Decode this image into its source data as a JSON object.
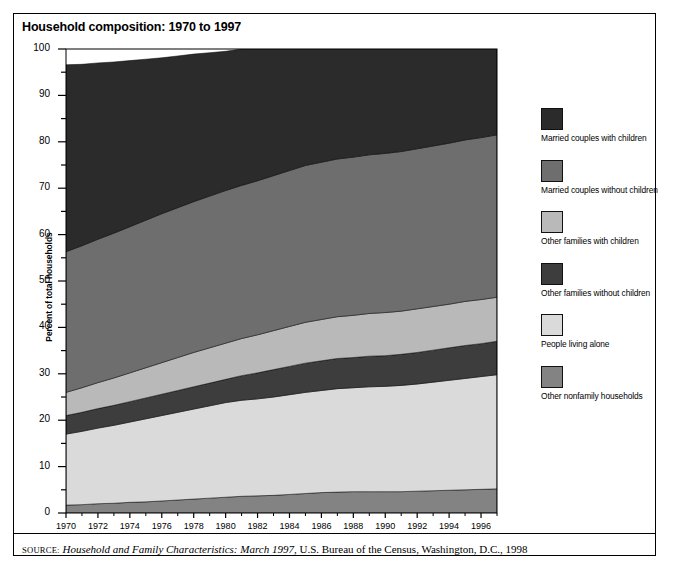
{
  "figure": {
    "title": "Household composition: 1970 to 1997",
    "source_label": "SOURCE:",
    "source_title": "Household and Family Characteristics: March 1997",
    "source_rest": ", U.S. Bureau of the Census, Washington, D.C., 1998"
  },
  "legend": {
    "items": [
      {
        "label": "Married couples with children",
        "color": "#2b2b2b"
      },
      {
        "label": "Married couples without children",
        "color": "#6e6e6e"
      },
      {
        "label": "Other families with children",
        "color": "#b9b9b9"
      },
      {
        "label": "Other families without children",
        "color": "#3d3d3d"
      },
      {
        "label": "People living alone",
        "color": "#dadada"
      },
      {
        "label": "Other nonfamily households",
        "color": "#838383"
      }
    ]
  },
  "chart_data": {
    "type": "area",
    "title": "Household composition: 1970 to 1997",
    "xlabel": "",
    "ylabel": "Percent of total households",
    "xlim": [
      1970,
      1997
    ],
    "ylim": [
      0,
      100
    ],
    "grid": false,
    "stacked": true,
    "stack_order_bottom_to_top": [
      "Other nonfamily households",
      "People living alone",
      "Other families without children",
      "Other families with children",
      "Married couples without children",
      "Married couples with children"
    ],
    "legend_position": "right",
    "x": [
      1970,
      1971,
      1972,
      1973,
      1974,
      1975,
      1976,
      1977,
      1978,
      1979,
      1980,
      1981,
      1982,
      1983,
      1984,
      1985,
      1986,
      1987,
      1988,
      1989,
      1990,
      1991,
      1992,
      1993,
      1994,
      1995,
      1996,
      1997
    ],
    "xticks": [
      1970,
      1972,
      1974,
      1976,
      1978,
      1980,
      1982,
      1984,
      1986,
      1988,
      1990,
      1992,
      1994,
      1996
    ],
    "xtick_labels": [
      "1970",
      "1972",
      "1974",
      "1976",
      "1978",
      "1980",
      "1982",
      "1984",
      "1986",
      "1988",
      "1990",
      "1992",
      "1994",
      "1996"
    ],
    "yticks": [
      0,
      10,
      20,
      30,
      40,
      50,
      60,
      70,
      80,
      90,
      100
    ],
    "ytick_labels": [
      "0",
      "10",
      "20",
      "30",
      "40",
      "50",
      "60",
      "70",
      "80",
      "90",
      "100"
    ],
    "yminorticks": [
      5,
      15,
      25,
      35,
      45,
      55,
      65,
      75,
      85,
      95
    ],
    "series": [
      {
        "name": "Other nonfamily households",
        "color": "#838383",
        "values": [
          1.7,
          1.8,
          2.0,
          2.1,
          2.3,
          2.4,
          2.6,
          2.8,
          3.0,
          3.2,
          3.4,
          3.6,
          3.7,
          3.8,
          4.0,
          4.2,
          4.4,
          4.5,
          4.6,
          4.6,
          4.6,
          4.6,
          4.7,
          4.8,
          4.9,
          5.0,
          5.1,
          5.2
        ]
      },
      {
        "name": "People living alone",
        "color": "#dadada",
        "values": [
          15.3,
          15.8,
          16.3,
          16.8,
          17.3,
          17.9,
          18.4,
          18.9,
          19.4,
          19.9,
          20.4,
          20.7,
          20.9,
          21.2,
          21.5,
          21.8,
          22.0,
          22.3,
          22.4,
          22.6,
          22.7,
          22.9,
          23.1,
          23.4,
          23.7,
          24.0,
          24.3,
          24.6
        ]
      },
      {
        "name": "Other families without children",
        "color": "#3d3d3d",
        "values": [
          4.0,
          4.1,
          4.2,
          4.3,
          4.4,
          4.5,
          4.6,
          4.7,
          4.8,
          4.9,
          5.0,
          5.3,
          5.6,
          5.9,
          6.1,
          6.3,
          6.4,
          6.5,
          6.5,
          6.6,
          6.6,
          6.7,
          6.8,
          6.9,
          7.0,
          7.1,
          7.1,
          7.2
        ]
      },
      {
        "name": "Other families with children",
        "color": "#b9b9b9",
        "values": [
          5.0,
          5.3,
          5.6,
          5.9,
          6.2,
          6.5,
          6.8,
          7.1,
          7.4,
          7.6,
          7.8,
          8.0,
          8.2,
          8.4,
          8.6,
          8.8,
          8.9,
          9.0,
          9.1,
          9.2,
          9.3,
          9.3,
          9.4,
          9.4,
          9.4,
          9.5,
          9.5,
          9.5
        ]
      },
      {
        "name": "Married couples without children",
        "color": "#6e6e6e",
        "values": [
          30.3,
          30.6,
          30.9,
          31.2,
          31.5,
          31.8,
          32.1,
          32.3,
          32.5,
          32.7,
          32.9,
          33.0,
          33.2,
          33.4,
          33.6,
          33.8,
          33.9,
          34.0,
          34.1,
          34.2,
          34.3,
          34.4,
          34.5,
          34.6,
          34.7,
          34.8,
          34.9,
          35.0
        ]
      },
      {
        "name": "Married couples with children",
        "color": "#2b2b2b",
        "values": [
          40.3,
          39.1,
          38.0,
          36.9,
          35.8,
          34.7,
          33.6,
          32.7,
          31.8,
          30.9,
          30.0,
          29.4,
          28.9,
          28.2,
          27.5,
          26.8,
          26.4,
          26.1,
          25.9,
          25.8,
          25.6,
          25.4,
          25.1,
          24.9,
          24.6,
          24.2,
          23.8,
          23.5
        ]
      }
    ],
    "derived_notes": {
      "cumulative_1970_tops": [
        1.7,
        17.0,
        21.0,
        26.0,
        56.3,
        96.6
      ],
      "cumulative_1997_tops": [
        5.2,
        29.8,
        37.0,
        46.5,
        81.5,
        105.0
      ]
    }
  },
  "plot_geometry": {
    "left_px": 66,
    "right_px": 497,
    "top_px": 49,
    "bottom_px": 513
  }
}
